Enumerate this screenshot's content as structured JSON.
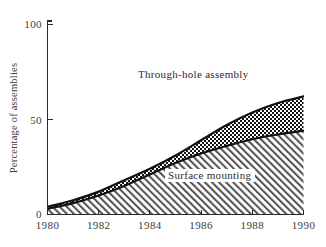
{
  "chart_data": {
    "type": "area",
    "title": "",
    "subtitle": "",
    "xlabel": "",
    "ylabel": "Percentage of assemblies",
    "xlim": [
      1980,
      1990
    ],
    "ylim": [
      0,
      100
    ],
    "grid": false,
    "stacked": true,
    "legend_position": "inline-annotations",
    "x": [
      1980,
      1981,
      1982,
      1983,
      1984,
      1985,
      1986,
      1987,
      1988,
      1989,
      1990
    ],
    "xticks": [
      1980,
      1982,
      1984,
      1986,
      1988,
      1990
    ],
    "xticklabels": [
      "1980",
      "1982",
      "1984",
      "1986",
      "1988",
      "1990"
    ],
    "yticks": [
      0,
      50,
      100
    ],
    "yticklabels": [
      "0",
      "50",
      "100"
    ],
    "series": [
      {
        "name": "Surface mounting",
        "fill": "diagonal-hatch",
        "values": [
          3,
          6,
          10,
          15,
          21,
          27,
          32,
          36,
          39.5,
          42,
          44
        ]
      },
      {
        "name": "Through-hole assembly",
        "fill": "checkerboard",
        "cumulative_top_values": [
          4,
          7.5,
          12,
          18,
          24,
          31,
          39,
          47,
          53.5,
          58.5,
          62
        ],
        "band_values": [
          1,
          1.5,
          2,
          3,
          3,
          4,
          7,
          11,
          14,
          16.5,
          18
        ]
      }
    ],
    "annotations": [
      {
        "text": "Through-hole assembly",
        "x": 1984.6,
        "y": 78
      },
      {
        "text": "Surface mounting",
        "x": 1986.1,
        "y": 22
      }
    ],
    "colors": {
      "axis": "#2b2b2b",
      "curve": "#111111",
      "text": "#3b3b3b",
      "background": "#ffffff",
      "hatch": "#555555",
      "checker": "#1a1a1a"
    }
  },
  "axes": {
    "y_title": "Percentage of assemblies",
    "y_tick_labels": [
      "100",
      "50",
      "0"
    ],
    "x_tick_labels": [
      "1980",
      "1982",
      "1984",
      "1986",
      "1988",
      "1990"
    ]
  },
  "annotations": {
    "through_hole": "Through-hole assembly",
    "surface_mounting": "Surface mounting"
  }
}
